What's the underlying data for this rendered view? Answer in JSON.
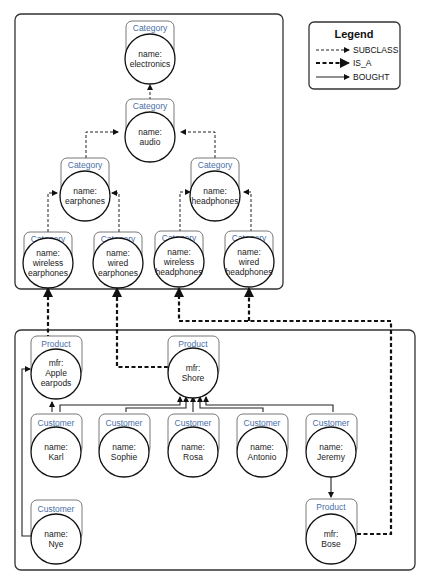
{
  "legend": {
    "title": "Legend",
    "items": [
      {
        "label": "SUBCLASS",
        "style": "thin-dashed-arrow"
      },
      {
        "label": "IS_A",
        "style": "thick-dashed-arrow"
      },
      {
        "label": "BOUGHT",
        "style": "solid-arrow"
      }
    ]
  },
  "category_nodes": [
    {
      "id": "electronics",
      "label": "Category",
      "lines": [
        "name:",
        "electronics"
      ]
    },
    {
      "id": "audio",
      "label": "Category",
      "lines": [
        "name:",
        "audio"
      ]
    },
    {
      "id": "earphones",
      "label": "Category",
      "lines": [
        "name:",
        "earphones"
      ]
    },
    {
      "id": "headphones",
      "label": "Category",
      "lines": [
        "name:",
        "headphones"
      ]
    },
    {
      "id": "wireless_earphones",
      "label": "Category",
      "lines": [
        "name:",
        "wireless",
        "earphones"
      ]
    },
    {
      "id": "wired_earphones",
      "label": "Category",
      "lines": [
        "name:",
        "wired",
        "earphones"
      ]
    },
    {
      "id": "wireless_headphones",
      "label": "Category",
      "lines": [
        "name:",
        "wireless",
        "headphones"
      ]
    },
    {
      "id": "wired_headphones",
      "label": "Category",
      "lines": [
        "name:",
        "wired",
        "headphones"
      ]
    }
  ],
  "product_nodes": [
    {
      "id": "apple",
      "label": "Product",
      "lines": [
        "mfr:",
        "Apple",
        "earpods"
      ]
    },
    {
      "id": "shore",
      "label": "Product",
      "lines": [
        "mfr:",
        "Shore"
      ]
    },
    {
      "id": "bose",
      "label": "Product",
      "lines": [
        "mfr:",
        "Bose"
      ]
    }
  ],
  "customer_nodes": [
    {
      "id": "karl",
      "label": "Customer",
      "lines": [
        "name:",
        "Karl"
      ]
    },
    {
      "id": "sophie",
      "label": "Customer",
      "lines": [
        "name:",
        "Sophie"
      ]
    },
    {
      "id": "rosa",
      "label": "Customer",
      "lines": [
        "name:",
        "Rosa"
      ]
    },
    {
      "id": "antonio",
      "label": "Customer",
      "lines": [
        "name:",
        "Antonio"
      ]
    },
    {
      "id": "jeremy",
      "label": "Customer",
      "lines": [
        "name:",
        "Jeremy"
      ]
    },
    {
      "id": "nye",
      "label": "Customer",
      "lines": [
        "name:",
        "Nye"
      ]
    }
  ],
  "edges": {
    "subclass": [
      [
        "audio",
        "electronics"
      ],
      [
        "earphones",
        "audio"
      ],
      [
        "headphones",
        "audio"
      ],
      [
        "wireless_earphones",
        "earphones"
      ],
      [
        "wired_earphones",
        "earphones"
      ],
      [
        "wireless_headphones",
        "headphones"
      ],
      [
        "wired_headphones",
        "headphones"
      ]
    ],
    "is_a": [
      [
        "apple",
        "wireless_earphones"
      ],
      [
        "shore",
        "wired_earphones"
      ],
      [
        "bose",
        "wireless_headphones"
      ],
      [
        "bose",
        "wired_headphones"
      ]
    ],
    "bought": [
      [
        "karl",
        "apple"
      ],
      [
        "nye",
        "apple"
      ],
      [
        "karl",
        "shore"
      ],
      [
        "sophie",
        "shore"
      ],
      [
        "rosa",
        "shore"
      ],
      [
        "antonio",
        "shore"
      ],
      [
        "jeremy",
        "shore"
      ],
      [
        "jeremy",
        "bose"
      ]
    ]
  }
}
